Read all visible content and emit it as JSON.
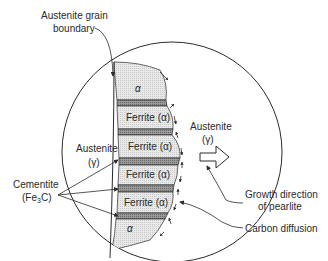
{
  "diagram": {
    "labels": {
      "grain_boundary_line1": "Austenite grain",
      "grain_boundary_line2": "boundary",
      "austenite_left_line1": "Austenite",
      "austenite_left_line2": "(γ)",
      "austenite_right_line1": "Austenite",
      "austenite_right_line2": "(γ)",
      "cementite_line1": "Cementite",
      "cementite_line2": "(Fe",
      "cementite_sub": "3",
      "cementite_line2_end": "C)",
      "growth_line1": "Growth direction",
      "growth_line2": "of pearlite",
      "carbon_diffusion": "Carbon diffusion"
    },
    "lamellae": [
      {
        "phase": "alpha",
        "label": "α"
      },
      {
        "phase": "cementite",
        "label": ""
      },
      {
        "phase": "ferrite",
        "label": "Ferrite (α)"
      },
      {
        "phase": "cementite",
        "label": ""
      },
      {
        "phase": "ferrite",
        "label": "Ferrite (α)"
      },
      {
        "phase": "cementite",
        "label": ""
      },
      {
        "phase": "ferrite",
        "label": "Ferrite (α)"
      },
      {
        "phase": "cementite",
        "label": ""
      },
      {
        "phase": "ferrite",
        "label": "Ferrite (α)"
      },
      {
        "phase": "cementite",
        "label": ""
      },
      {
        "phase": "alpha",
        "label": "α"
      }
    ],
    "colors": {
      "ferrite_fill": "#e6e6e6",
      "cementite_fill": "#8c8c8c",
      "line": "#2a2a2a",
      "background": "#ffffff"
    }
  }
}
